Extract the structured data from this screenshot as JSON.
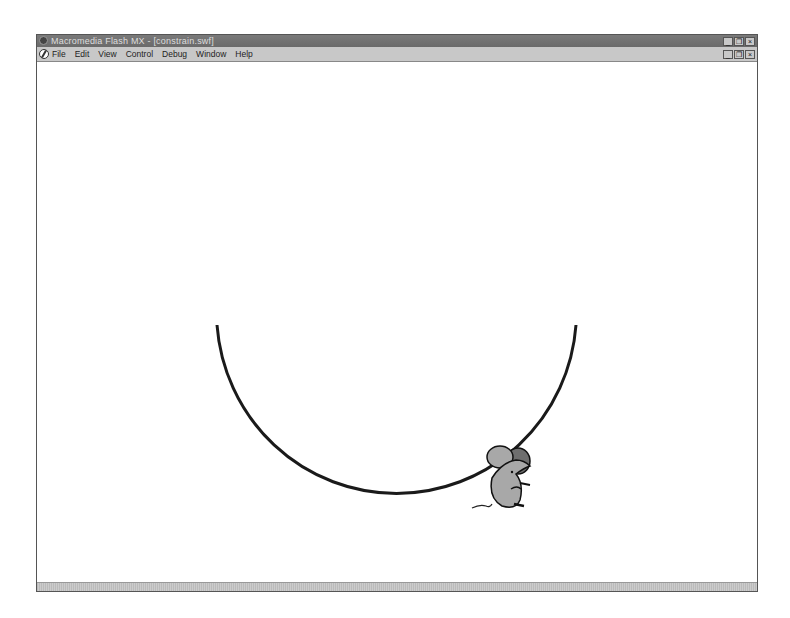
{
  "window": {
    "title": "Macromedia Flash MX - [constrain.swf]",
    "controls": [
      "minimize",
      "restore",
      "close"
    ]
  },
  "menubar": {
    "items": [
      {
        "label": "File"
      },
      {
        "label": "Edit"
      },
      {
        "label": "View"
      },
      {
        "label": "Control"
      },
      {
        "label": "Debug"
      },
      {
        "label": "Window"
      },
      {
        "label": "Help"
      }
    ]
  },
  "stage": {
    "arc": {
      "center_x": 396,
      "center_y": 327,
      "radius": 180,
      "stroke": "#1a1a1a"
    },
    "character": {
      "name": "mouse",
      "body_color": "#a8a8a8",
      "ear_color": "#707070"
    }
  },
  "button_glyphs": {
    "minimize": "_",
    "restore": "❐",
    "close": "×"
  }
}
